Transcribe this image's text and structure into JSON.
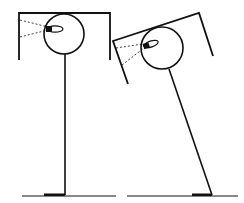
{
  "diagram": {
    "colors": {
      "stroke": "#111111",
      "background": "#ffffff"
    },
    "figures": [
      {
        "name": "upright-figure",
        "posture": "upright"
      },
      {
        "name": "tilted-figure",
        "posture": "tilted"
      }
    ]
  }
}
